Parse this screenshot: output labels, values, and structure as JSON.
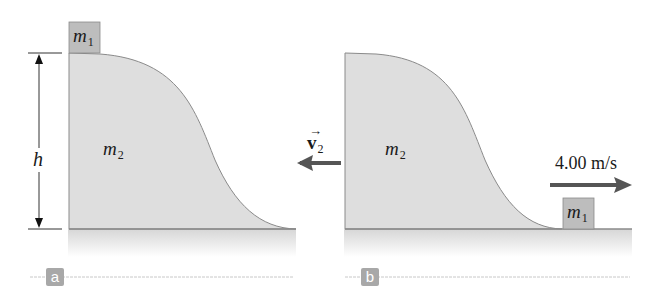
{
  "figure": {
    "panels": [
      {
        "tag": "a",
        "block_label": {
          "symbol": "m",
          "subscript": "1"
        },
        "wedge_label": {
          "symbol": "m",
          "subscript": "2"
        },
        "height_label": "h"
      },
      {
        "tag": "b",
        "block_label": {
          "symbol": "m",
          "subscript": "1"
        },
        "wedge_label": {
          "symbol": "m",
          "subscript": "2"
        },
        "wedge_velocity": {
          "symbol": "v",
          "subscript": "2",
          "direction": "left"
        },
        "block_velocity": {
          "value": "4.00 m/s",
          "direction": "right"
        }
      }
    ],
    "colors": {
      "wedge_fill": "#dedede",
      "block_fill": "#bdbdbd",
      "arrow": "#555555",
      "tag_bg": "#a8a8a8",
      "ground_line": "#8c8c8c"
    }
  }
}
